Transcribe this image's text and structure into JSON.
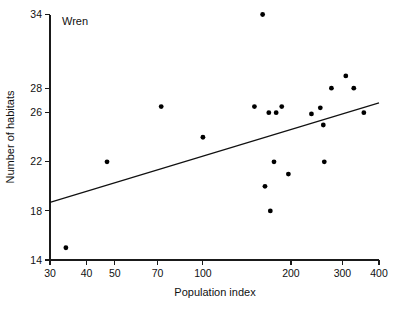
{
  "chart_data": {
    "type": "scatter",
    "title": "",
    "annotation": "Wren",
    "xlabel": "Population index",
    "ylabel": "Number of habitats",
    "xscale": "log",
    "yscale": "linear",
    "xlim": [
      30,
      400
    ],
    "ylim": [
      14,
      34
    ],
    "grid": false,
    "legend": "none",
    "xticks": [
      30,
      40,
      50,
      70,
      100,
      200,
      300,
      400
    ],
    "xtick_labels": [
      "30",
      "40",
      "50",
      "70",
      "100",
      "200",
      "300",
      "400"
    ],
    "yticks": [
      14,
      18,
      22,
      26,
      28,
      34
    ],
    "ytick_labels": [
      "14",
      "18",
      "22",
      "26",
      "28",
      "34"
    ],
    "points": [
      {
        "x": 34,
        "y": 15.0
      },
      {
        "x": 47,
        "y": 22.0
      },
      {
        "x": 72,
        "y": 26.5
      },
      {
        "x": 100,
        "y": 24.0
      },
      {
        "x": 150,
        "y": 26.5
      },
      {
        "x": 160,
        "y": 34.0
      },
      {
        "x": 163,
        "y": 20.0
      },
      {
        "x": 168,
        "y": 26.0
      },
      {
        "x": 170,
        "y": 18.0
      },
      {
        "x": 175,
        "y": 22.0
      },
      {
        "x": 178,
        "y": 26.0
      },
      {
        "x": 186,
        "y": 26.5
      },
      {
        "x": 196,
        "y": 21.0
      },
      {
        "x": 235,
        "y": 25.9
      },
      {
        "x": 252,
        "y": 26.4
      },
      {
        "x": 258,
        "y": 25.0
      },
      {
        "x": 260,
        "y": 22.0
      },
      {
        "x": 275,
        "y": 28.0
      },
      {
        "x": 308,
        "y": 29.0
      },
      {
        "x": 328,
        "y": 28.0
      },
      {
        "x": 355,
        "y": 26.0
      }
    ],
    "trendline": {
      "label": "regression line",
      "x_start": 30,
      "y_start": 18.7,
      "x_end": 400,
      "y_end": 26.8
    }
  },
  "figure": {
    "series_label": "Wren",
    "axis_color": "#1a1a1a",
    "point_color": "#000000",
    "background": "#ffffff"
  }
}
